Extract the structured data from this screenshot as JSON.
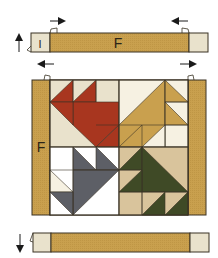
{
  "diagram": {
    "colors": {
      "gold": "#c9a04e",
      "light": "#e9e2cc",
      "cream": "#f6f1e2",
      "tan": "#d9c49c",
      "red": "#a8361f",
      "gray": "#5d5f66",
      "green": "#3f4a26",
      "outline": "#3a3325",
      "arrow": "#1a1a1a"
    },
    "top_strip": {
      "center_label": "F",
      "left_end_label": "I",
      "side_arrow": "up-arrow-icon",
      "press_arrows": [
        "right-arrow-icon",
        "left-arrow-icon"
      ]
    },
    "middle": {
      "side_label": "F",
      "press_arrows": [
        "left-arrow-icon",
        "right-arrow-icon"
      ],
      "blocks": [
        {
          "position": "top-left",
          "color": "red"
        },
        {
          "position": "top-right",
          "color": "gold"
        },
        {
          "position": "bottom-left",
          "color": "gray"
        },
        {
          "position": "bottom-right",
          "color": "green"
        }
      ]
    },
    "bottom_strip": {
      "side_arrow": "down-arrow-icon"
    }
  }
}
